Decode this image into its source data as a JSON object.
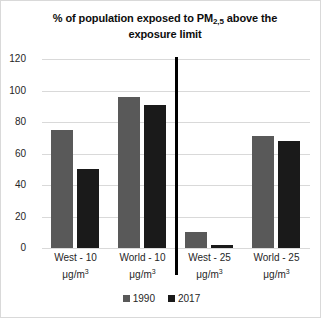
{
  "chart_data": {
    "type": "bar",
    "title": "% of population exposed to PM2,5 above the exposure limit",
    "title_main_part1": "% of population exposed to PM",
    "title_subscript": "2,5",
    "title_main_part2": " above the",
    "title_line2": "exposure limit",
    "xlabel": "",
    "ylabel": "",
    "ylim": [
      0,
      120
    ],
    "ytick_step": 20,
    "yticks": [
      "120",
      "100",
      "80",
      "60",
      "40",
      "20",
      "0"
    ],
    "grid": true,
    "legend_position": "bottom",
    "categories": [
      "West - 10 μg/m³",
      "World - 10 μg/m³",
      "West - 25 μg/m³",
      "World - 25 μg/m³"
    ],
    "category_parts": [
      {
        "name": "West - 10",
        "unit": "μg/m",
        "unit_exp": "3"
      },
      {
        "name": "World - 10",
        "unit": "μg/m",
        "unit_exp": "3"
      },
      {
        "name": "West - 25",
        "unit": "μg/m",
        "unit_exp": "3"
      },
      {
        "name": "World - 25",
        "unit": "μg/m",
        "unit_exp": "3"
      }
    ],
    "series": [
      {
        "name": "1990",
        "color": "#595959",
        "values": [
          75,
          96,
          10,
          2
        ]
      },
      {
        "name": "2017",
        "color": "#1a1a1a",
        "values": [
          50,
          91,
          2,
          68
        ]
      }
    ],
    "series_corrected": [
      {
        "name": "1990",
        "color": "#595959",
        "values": [
          75,
          96,
          10,
          71
        ]
      },
      {
        "name": "2017",
        "color": "#1a1a1a",
        "values": [
          50,
          91,
          2,
          68
        ]
      }
    ],
    "annotations": [
      {
        "type": "vertical-divider",
        "after_category_index": 1,
        "color": "#000000"
      }
    ]
  },
  "legend": {
    "items": [
      {
        "label": "1990",
        "color": "#595959"
      },
      {
        "label": "2017",
        "color": "#1a1a1a"
      }
    ]
  },
  "colors": {
    "gridline": "#d9d9d9",
    "text": "#262626",
    "title": "#0d0d0d",
    "divider": "#000000",
    "background": "#ffffff",
    "border": "#d9d9d9"
  }
}
